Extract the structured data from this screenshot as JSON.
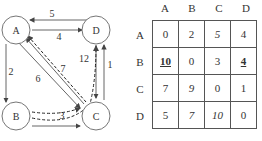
{
  "graph": {
    "nodes": [
      {
        "id": "A",
        "label": "A"
      },
      {
        "id": "B",
        "label": "B"
      },
      {
        "id": "C",
        "label": "C"
      },
      {
        "id": "D",
        "label": "D"
      }
    ],
    "edges": [
      {
        "from": "D",
        "to": "A",
        "weight": "5",
        "style": "solid"
      },
      {
        "from": "A",
        "to": "D",
        "weight": "4",
        "style": "solid"
      },
      {
        "from": "A",
        "to": "B",
        "weight": "2",
        "style": "solid"
      },
      {
        "from": "A",
        "to": "C",
        "weight": "6",
        "style": "solid"
      },
      {
        "from": "C",
        "to": "A",
        "weight": "7",
        "style": "solid"
      },
      {
        "from": "C",
        "to": "D",
        "weight": "1",
        "style": "solid"
      },
      {
        "from": "D",
        "to": "C",
        "weight": "12",
        "style": "solid"
      },
      {
        "from": "B",
        "to": "C",
        "weight": "",
        "style": "solid"
      },
      {
        "from": "B",
        "to": "C",
        "weight": "3",
        "style": "dashed"
      },
      {
        "from": "C",
        "to": "A",
        "weight": "",
        "style": "dashed"
      },
      {
        "from": "C",
        "to": "D",
        "weight": "",
        "style": "dashed"
      }
    ],
    "labels": {
      "w5": "5",
      "w4": "4",
      "w2": "2",
      "w6": "6",
      "w7": "7",
      "w12": "12",
      "w1": "1",
      "w3": "3",
      "A": "A",
      "B": "B",
      "C": "C",
      "D": "D"
    }
  },
  "matrix": {
    "col_headers": [
      "A",
      "B",
      "C",
      "D"
    ],
    "row_headers": [
      "A",
      "B",
      "C",
      "D"
    ],
    "rows": [
      [
        "0",
        "2",
        "5",
        "4"
      ],
      [
        "10",
        "0",
        "3",
        "4"
      ],
      [
        "7",
        "9",
        "0",
        "1"
      ],
      [
        "5",
        "7",
        "10",
        "0"
      ]
    ]
  }
}
